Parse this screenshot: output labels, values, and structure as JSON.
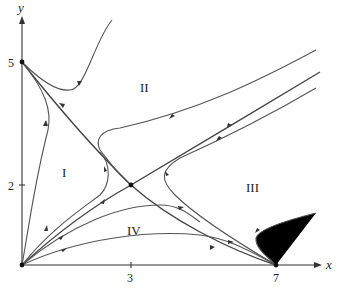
{
  "figure": {
    "type": "phase-portrait",
    "axes": {
      "x_label": "x",
      "y_label": "y",
      "x_ticks": [
        {
          "value": 3,
          "label": "3"
        },
        {
          "value": 7,
          "label": "7"
        }
      ],
      "y_ticks": [
        {
          "value": 2,
          "label": "2"
        },
        {
          "value": 5,
          "label": "5"
        }
      ]
    },
    "regions": [
      {
        "id": "I",
        "label": "I"
      },
      {
        "id": "II",
        "label": "II"
      },
      {
        "id": "III",
        "label": "III"
      },
      {
        "id": "IV",
        "label": "IV"
      }
    ],
    "equilibria": [
      {
        "name": "origin",
        "x": 0,
        "y": 0,
        "kind": "unstable-node"
      },
      {
        "name": "y-axis-point",
        "x": 0,
        "y": 5,
        "kind": "stable-node"
      },
      {
        "name": "x-axis-point",
        "x": 7,
        "y": 0,
        "kind": "stable-node"
      },
      {
        "name": "coexistence",
        "x": 3,
        "y": 2,
        "kind": "saddle"
      }
    ],
    "colors": {
      "curve": "#555555",
      "separatrix": "#444444",
      "axis": "#333333",
      "background": "#ffffff"
    }
  }
}
